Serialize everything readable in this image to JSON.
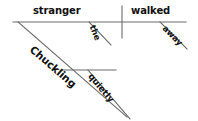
{
  "diagram": {
    "type": "reed-kellogg-sentence-diagram",
    "sentence": "Chuckling quietly, the stranger walked away.",
    "line_color": "#6b6b6b",
    "text_color": "#101010",
    "background": "#ffffff",
    "labels": {
      "subject": "stranger",
      "verb": "walked",
      "article": "the",
      "adverb_verb": "away",
      "participle": "Chuckling",
      "adverb_participle": "quietly"
    },
    "parts": [
      {
        "word": "stranger",
        "role": "subject",
        "position": "baseline-left"
      },
      {
        "word": "walked",
        "role": "verb",
        "position": "baseline-right"
      },
      {
        "word": "the",
        "role": "article-modifier",
        "position": "diagonal-under-subject"
      },
      {
        "word": "away",
        "role": "adverb-modifier",
        "position": "diagonal-under-verb"
      },
      {
        "word": "Chuckling",
        "role": "participle",
        "position": "main-diagonal-under-subject"
      },
      {
        "word": "quietly",
        "role": "adverb-of-participle",
        "position": "diagonal-under-participle"
      }
    ]
  }
}
